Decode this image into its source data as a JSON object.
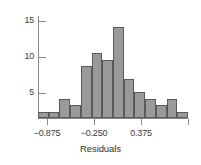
{
  "chart_data": {
    "type": "bar",
    "title": "",
    "subtitle": "",
    "xlabel": "Residuals",
    "ylabel": "",
    "grid": false,
    "legend": null,
    "bin_width": 0.125,
    "bin_starts": [
      -1.0,
      -0.875,
      -0.75,
      -0.625,
      -0.5,
      -0.375,
      -0.25,
      -0.125,
      0.0,
      0.125,
      0.25,
      0.375,
      0.5,
      0.625
    ],
    "categories": [
      "-1.000",
      "-0.875",
      "-0.750",
      "-0.625",
      "-0.500",
      "-0.375",
      "-0.250",
      "-0.125",
      "0.000",
      "0.125",
      "0.250",
      "0.375",
      "0.500",
      "0.625"
    ],
    "values": [
      1,
      1,
      3,
      2,
      8,
      10,
      9,
      14,
      6,
      4,
      3,
      2,
      3,
      1
    ],
    "xlim": [
      -1.0,
      1.0
    ],
    "ylim": [
      0,
      16
    ],
    "x_ticks": [
      -0.875,
      -0.25,
      0.375,
      1.0
    ],
    "x_tick_labels": [
      "−0.875",
      "−0.250",
      "0.375",
      ""
    ],
    "y_ticks": [
      5,
      10,
      15
    ],
    "y_tick_labels": [
      "5",
      "10",
      "15"
    ],
    "bar_fill": "#9a9a9a",
    "bar_stroke": "#5a5a5a",
    "axis_color": "#8a8a8a",
    "text_color": "#3a3a3a"
  }
}
